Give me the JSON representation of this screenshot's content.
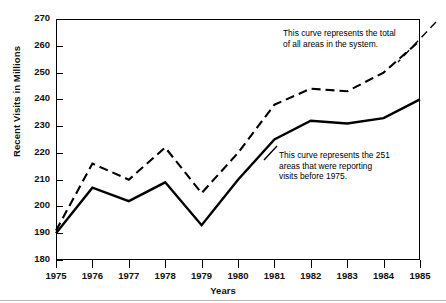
{
  "chart_data": {
    "type": "line",
    "title": "",
    "xlabel": "Years",
    "ylabel": "Recent Visits in Millions",
    "x": [
      1975,
      1976,
      1977,
      1978,
      1979,
      1980,
      1981,
      1982,
      1983,
      1984,
      1985
    ],
    "xticklabels": [
      "1975",
      "1976",
      "1977",
      "1978",
      "1979",
      "1980",
      "1981",
      "1982",
      "1983",
      "1984",
      "1985"
    ],
    "yticks": [
      180,
      190,
      200,
      210,
      220,
      230,
      240,
      250,
      260,
      270
    ],
    "yticklabels": [
      "180",
      "190",
      "200",
      "210",
      "220",
      "230",
      "240",
      "250",
      "260",
      "270"
    ],
    "xlim": [
      1975,
      1985
    ],
    "ylim": [
      180,
      270
    ],
    "grid": false,
    "legend": false,
    "series": [
      {
        "name": "Total of all areas in the system",
        "style": "dashed",
        "color": "#000000",
        "values": [
          191,
          216,
          210,
          222,
          205,
          220,
          238,
          244,
          243,
          250,
          262
        ]
      },
      {
        "name": "251 areas reporting visits before 1975",
        "style": "solid",
        "color": "#000000",
        "values": [
          190,
          207,
          202,
          209,
          193,
          210,
          225,
          232,
          231,
          233,
          240
        ]
      }
    ],
    "annotations": [
      {
        "key": "total",
        "text": "This curve represents the total\nof all areas in the system.",
        "target_series": "Total of all areas in the system"
      },
      {
        "key": "subset",
        "text": "This curve represents the 251\nareas that were reporting\nvisits before 1975.",
        "target_series": "251 areas reporting visits before 1975"
      }
    ]
  }
}
